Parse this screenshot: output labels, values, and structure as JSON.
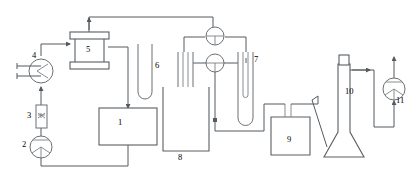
{
  "diagram": {
    "type": "process-flow-diagram",
    "stroke_color": "#555a5e",
    "vessel_color": "#6b7074",
    "background": "#ffffff",
    "label_color": "#3a3f43"
  },
  "components": [
    {
      "id": "1",
      "label": "1",
      "name": "rectangular-tank",
      "x": 121,
      "y": 137
    },
    {
      "id": "2",
      "label": "2",
      "name": "feed-pump",
      "x": 25,
      "y": 146
    },
    {
      "id": "3",
      "label": "3",
      "name": "rotameter-flowmeter",
      "x": 34,
      "y": 117
    },
    {
      "id": "4",
      "label": "4",
      "name": "heat-exchanger",
      "x": 35,
      "y": 62
    },
    {
      "id": "5",
      "label": "5",
      "name": "flanged-reactor",
      "x": 89,
      "y": 55
    },
    {
      "id": "6",
      "label": "6",
      "name": "u-tube",
      "x": 152,
      "y": 68
    },
    {
      "id": "7",
      "label": "7",
      "name": "gas-bubbler-tube",
      "x": 255,
      "y": 62
    },
    {
      "id": "8",
      "label": "8",
      "name": "cooling-bath-beaker",
      "x": 181,
      "y": 141
    },
    {
      "id": "9",
      "label": "9",
      "name": "gas-washing-bottle",
      "x": 290,
      "y": 137
    },
    {
      "id": "10",
      "label": "10",
      "name": "absorption-column",
      "x": 349,
      "y": 72
    },
    {
      "id": "11",
      "label": "11",
      "name": "vacuum-pump",
      "x": 394,
      "y": 88
    }
  ],
  "icons": {
    "pump": "pump-impeller-icon",
    "heat_exchanger": "heat-exchanger-chevron-icon",
    "valve": "three-way-valve-icon",
    "flowmeter": "rotameter-icon",
    "flow_arrow": "flow-direction-arrow-icon"
  }
}
